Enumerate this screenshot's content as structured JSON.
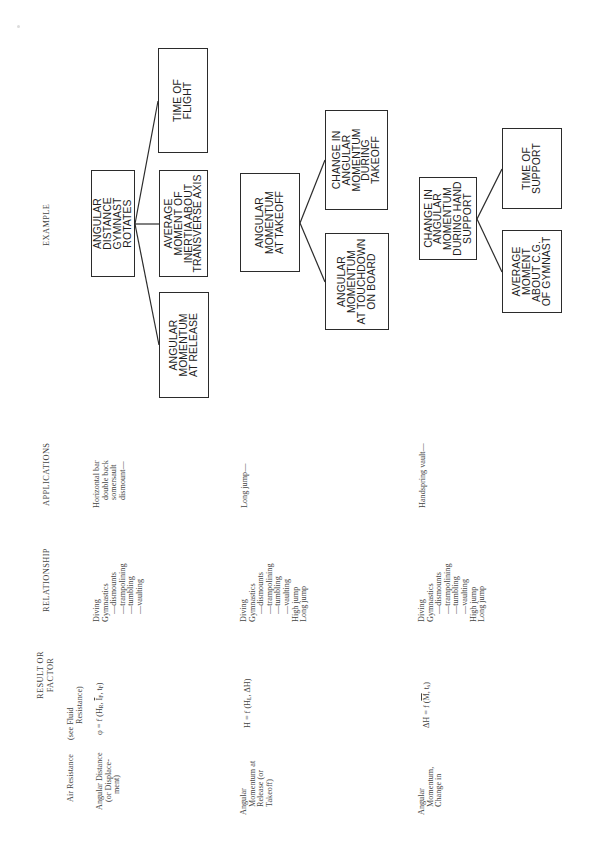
{
  "page": {
    "orientation": "rotated 90 degrees counter-clockwise",
    "columns": {
      "result_or_factor": [
        "RESULT OR",
        "FACTOR"
      ],
      "relationship": "RELATIONSHIP",
      "applications": "APPLICATIONS",
      "example": "EXAMPLE"
    },
    "rows": [
      {
        "factor": [
          "Air Resistance"
        ],
        "relationship_formula": [
          "(see Fluid",
          "Resistance)"
        ]
      },
      {
        "factor": [
          "Angular Distance",
          "(or Displace-",
          "ment)"
        ],
        "relationship_formula": "φ = f (H",
        "formula_parts": {
          "lhs": "φ = f (H",
          "sub1": "R",
          "mid1": ", ",
          "bar_var": "I",
          "sub2": "F",
          "mid2": ", t",
          "sub3": "F",
          "end": ")"
        },
        "applications": [
          "Diving",
          "Gymnastics",
          "—dismounts",
          "—trampolining",
          "—tumbling",
          "—vaulting"
        ],
        "example_application": [
          "Horizontal bar",
          "double back",
          "somersault",
          "dismount—"
        ],
        "diagram": {
          "root": "ANGULAR\nDISTANCE\nGYMNAST\nROTATES",
          "children": [
            "ANGULAR\nMOMENTUM\nAT RELEASE",
            "AVERAGE\nMOMENT OF\nINERTIA ABOUT\nTRANSVERSE AXIS",
            "TIME OF\nFLIGHT"
          ]
        }
      },
      {
        "factor": [
          "Angular",
          "Momentum at",
          "Release (or",
          "Takeoff)"
        ],
        "formula_parts": {
          "lhs": "H = f (H",
          "sub1": "L",
          "end": ", ΔH)"
        },
        "applications": [
          "Diving",
          "Gymnastics",
          "—dismounts",
          "—trampolining",
          "—tumbling",
          "—vaulting",
          "High jump",
          "Long jump"
        ],
        "example_application": [
          "Long jump—"
        ],
        "diagram": {
          "root": "ANGULAR\nMOMENTUM\nAT TAKEOFF",
          "children": [
            "ANGULAR\nMOMENTUM\nAT TOUCHDOWN\nON BOARD",
            "CHANGE IN\nANGULAR\nMOMENTUM\nDURING\nTAKEOFF"
          ]
        }
      },
      {
        "factor": [
          "Angular",
          "Momentum,",
          "Change in"
        ],
        "formula_parts": {
          "lhs": "ΔH = f (",
          "bar_var": "M",
          "mid": ", t",
          "sub1": "s",
          "end": ")"
        },
        "applications": [
          "Diving",
          "Gymnastics",
          "—dismounts",
          "—trampolining",
          "—tumbling",
          "—vaulting",
          "High jump",
          "Long jump"
        ],
        "example_application": [
          "Handspring vault—"
        ],
        "diagram": {
          "root": "CHANGE IN\nANGULAR\nMOMENTUM\nDURING HAND\nSUPPORT",
          "children": [
            "AVERAGE\nMOMENT\nABOUT C.G.\nOF GYMNAST",
            "TIME OF\nSUPPORT"
          ]
        }
      }
    ]
  }
}
